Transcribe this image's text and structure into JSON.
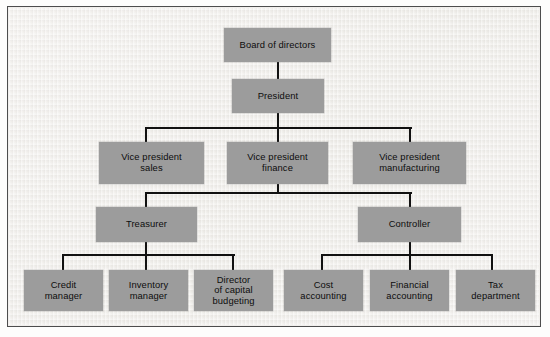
{
  "diagram": {
    "type": "org-chart",
    "colors": {
      "box_fill": "#9c9c9c",
      "box_text": "#0d0d0d",
      "connector": "#111111",
      "background": "#f1efec",
      "frame": "#4d4d4d"
    },
    "levels": [
      {
        "level": 1,
        "nodes": [
          "board_of_directors"
        ]
      },
      {
        "level": 2,
        "nodes": [
          "president"
        ]
      },
      {
        "level": 3,
        "nodes": [
          "vp_sales",
          "vp_finance",
          "vp_manufacturing"
        ]
      },
      {
        "level": 4,
        "nodes": [
          "treasurer",
          "controller"
        ]
      },
      {
        "level": 5,
        "nodes": [
          "credit_manager",
          "inventory_manager",
          "director_capital_budgeting",
          "cost_accounting",
          "financial_accounting",
          "tax_department"
        ]
      }
    ],
    "nodes": {
      "board_of_directors": {
        "label": "Board of directors"
      },
      "president": {
        "label": "President"
      },
      "vp_sales": {
        "label": "Vice president\nsales"
      },
      "vp_finance": {
        "label": "Vice president\nfinance"
      },
      "vp_manufacturing": {
        "label": "Vice president\nmanufacturing"
      },
      "treasurer": {
        "label": "Treasurer"
      },
      "controller": {
        "label": "Controller"
      },
      "credit_manager": {
        "label": "Credit\nmanager"
      },
      "inventory_manager": {
        "label": "Inventory\nmanager"
      },
      "director_capital_budgeting": {
        "label": "Director\nof capital\nbudgeting"
      },
      "cost_accounting": {
        "label": "Cost\naccounting"
      },
      "financial_accounting": {
        "label": "Financial\naccounting"
      },
      "tax_department": {
        "label": "Tax\ndepartment"
      }
    },
    "edges": [
      {
        "from": "board_of_directors",
        "to": "president"
      },
      {
        "from": "president",
        "to": "vp_sales"
      },
      {
        "from": "president",
        "to": "vp_finance"
      },
      {
        "from": "president",
        "to": "vp_manufacturing"
      },
      {
        "from": "vp_finance",
        "to": "treasurer"
      },
      {
        "from": "vp_finance",
        "to": "controller"
      },
      {
        "from": "treasurer",
        "to": "credit_manager"
      },
      {
        "from": "treasurer",
        "to": "inventory_manager"
      },
      {
        "from": "treasurer",
        "to": "director_capital_budgeting"
      },
      {
        "from": "controller",
        "to": "cost_accounting"
      },
      {
        "from": "controller",
        "to": "financial_accounting"
      },
      {
        "from": "controller",
        "to": "tax_department"
      }
    ]
  }
}
